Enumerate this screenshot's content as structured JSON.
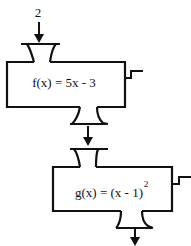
{
  "diagram": {
    "type": "function-machine-composition",
    "input_label": "2",
    "machines": [
      {
        "name": "f",
        "formula": "f(x) = 5x - 3",
        "formula_base": "f(x) = 5x - 3"
      },
      {
        "name": "g",
        "formula": "g(x) = (x - 1)^2",
        "formula_base": "g(x) = (x - 1)",
        "exponent": "2"
      }
    ],
    "colors": {
      "stroke": "#111111",
      "background": "#ffffff"
    }
  }
}
